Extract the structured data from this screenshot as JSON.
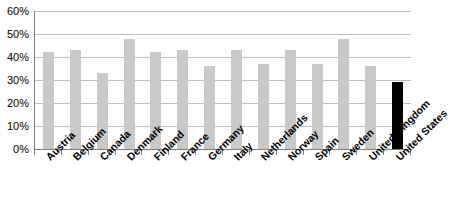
{
  "chart_data": {
    "type": "bar",
    "title": "",
    "xlabel": "",
    "ylabel": "",
    "ylim": [
      0,
      60
    ],
    "y_ticks": [
      0,
      10,
      20,
      30,
      40,
      50,
      60
    ],
    "y_tick_labels": [
      "0%",
      "10%",
      "20%",
      "30%",
      "40%",
      "50%",
      "60%"
    ],
    "grid": true,
    "legend": "none",
    "value_suffix": "%",
    "categories": [
      "Austria",
      "Belgium",
      "Canada",
      "Denmark",
      "Finland",
      "France",
      "Germany",
      "Italy",
      "Netherlands",
      "Norway",
      "Spain",
      "Sweden",
      "United Kingdom",
      "United States"
    ],
    "values": [
      42,
      43,
      33,
      48,
      42,
      43,
      36,
      43,
      37,
      43,
      37,
      48,
      36,
      29
    ],
    "series": [
      {
        "name": "Share",
        "values": [
          42,
          43,
          33,
          48,
          42,
          43,
          36,
          43,
          37,
          43,
          37,
          48,
          36,
          29
        ]
      }
    ],
    "bar_colors": [
      "#c9c9c9",
      "#c9c9c9",
      "#c9c9c9",
      "#c9c9c9",
      "#c9c9c9",
      "#c9c9c9",
      "#c9c9c9",
      "#c9c9c9",
      "#c9c9c9",
      "#c9c9c9",
      "#c9c9c9",
      "#c9c9c9",
      "#c9c9c9",
      "#000000"
    ],
    "highlight_category": "United States",
    "colors": {
      "bar_default": "#c9c9c9",
      "bar_highlight": "#000000",
      "gridline": "#bfbfbf",
      "axis": "#7f7f7f",
      "text": "#000000",
      "background": "#ffffff"
    }
  }
}
